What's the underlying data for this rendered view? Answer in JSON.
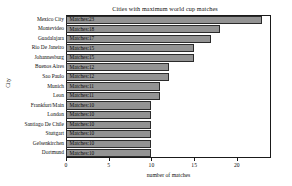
{
  "chart_data": {
    "type": "bar",
    "orientation": "horizontal",
    "title": "Cities with maximum world cup matches",
    "xlabel": "number of matches",
    "ylabel": "City",
    "categories": [
      "Mexico City",
      "Montevideo",
      "Guadalajara",
      "Rio De Janeiro",
      "Johannesburg",
      "Buenos Aires",
      "Sao Paulo",
      "Munich",
      "Leon",
      "Frankfurt/Main",
      "London",
      "Santiago De Chile",
      "Stuttgart",
      "Gelsenkirchen",
      "Dortmund"
    ],
    "values": [
      23,
      18,
      17,
      15,
      15,
      12,
      12,
      11,
      11,
      10,
      10,
      10,
      10,
      10,
      10
    ],
    "bar_labels": [
      "Matches:23",
      "Matches:18",
      "Matches:17",
      "Matches:15",
      "Matches:15",
      "Matches:12",
      "Matches:12",
      "Matches:11",
      "Matches:11",
      "Matches:10",
      "Matches:10",
      "Matches:10",
      "Matches:10",
      "Matches:10",
      "Matches:10"
    ],
    "xlim": [
      0,
      24
    ],
    "xticks": [
      0,
      5,
      10,
      15,
      20
    ],
    "xtick_labels": [
      "0",
      "5",
      "10",
      "15",
      "20"
    ],
    "grid": false,
    "legend": null,
    "colors": {
      "bar_fill": "#939393",
      "bar_edge": "#2b2b2b",
      "axis": "#1a1a1a",
      "text": "#0d0d0d",
      "background": "#ffffff"
    }
  }
}
